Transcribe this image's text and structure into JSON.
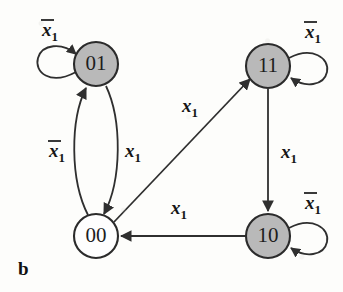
{
  "figure": {
    "caption": "b",
    "type": "state-transition-diagram",
    "background_color": "#fdfdfb",
    "filled_node_color": "#b9b9b9",
    "open_node_color": "#fefefe",
    "stroke_color": "#2f2f2f"
  },
  "nodes": [
    {
      "id": "n01",
      "label": "01",
      "fill": "gray",
      "cx": 96,
      "cy": 64,
      "r": 22
    },
    {
      "id": "n11",
      "label": "11",
      "fill": "gray",
      "cx": 268,
      "cy": 66,
      "r": 22
    },
    {
      "id": "n00",
      "label": "00",
      "fill": "white",
      "cx": 96,
      "cy": 236,
      "r": 22
    },
    {
      "id": "n10",
      "label": "10",
      "fill": "gray",
      "cx": 268,
      "cy": 236,
      "r": 22
    }
  ],
  "edges": [
    {
      "id": "e-01-self",
      "from": "01",
      "to": "01",
      "label_base": "x",
      "label_bar": true,
      "label_sub": "1",
      "label_x": 50,
      "label_y": 36,
      "kind": "self-loop-left"
    },
    {
      "id": "e-11-self",
      "from": "11",
      "to": "11",
      "label_base": "x",
      "label_bar": true,
      "label_sub": "1",
      "label_x": 313,
      "label_y": 38,
      "kind": "self-loop-right"
    },
    {
      "id": "e-10-self",
      "from": "10",
      "to": "10",
      "label_base": "x",
      "label_bar": true,
      "label_sub": "1",
      "label_x": 313,
      "label_y": 209,
      "kind": "self-loop-right"
    },
    {
      "id": "e-00-01",
      "from": "00",
      "to": "01",
      "label_base": "x",
      "label_bar": true,
      "label_sub": "1",
      "label_x": 57,
      "label_y": 157,
      "kind": "curve-left-up"
    },
    {
      "id": "e-01-00",
      "from": "01",
      "to": "00",
      "label_base": "x",
      "label_bar": false,
      "label_sub": "1",
      "label_x": 133,
      "label_y": 157,
      "kind": "curve-right-down"
    },
    {
      "id": "e-00-11",
      "from": "00",
      "to": "11",
      "label_base": "x",
      "label_bar": false,
      "label_sub": "1",
      "label_x": 190,
      "label_y": 112,
      "kind": "diagonal"
    },
    {
      "id": "e-11-10",
      "from": "11",
      "to": "10",
      "label_base": "x",
      "label_bar": false,
      "label_sub": "1",
      "label_x": 289,
      "label_y": 158,
      "kind": "vertical"
    },
    {
      "id": "e-10-00",
      "from": "10",
      "to": "00",
      "label_base": "x",
      "label_bar": false,
      "label_sub": "1",
      "label_x": 179,
      "label_y": 214,
      "kind": "horizontal"
    }
  ]
}
